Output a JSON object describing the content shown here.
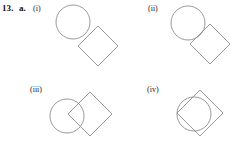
{
  "exercise": {
    "number": "13.",
    "part": "a."
  },
  "panels": [
    {
      "label": "(i)",
      "label_x": 33,
      "label_y": 4,
      "box": {
        "x": 50,
        "y": 2,
        "w": 73,
        "h": 68
      },
      "relation": "disjoint-touching",
      "circle": {
        "cx": 23,
        "cy": 20,
        "r": 17
      },
      "square": {
        "cx": 48,
        "cy": 44,
        "half_diagonal": 20,
        "rotation_deg": 45
      }
    },
    {
      "label": "(ii)",
      "label_x": 148,
      "label_y": 4,
      "box": {
        "x": 165,
        "y": 2,
        "w": 76,
        "h": 68
      },
      "relation": "tangent-point",
      "circle": {
        "cx": 23,
        "cy": 21,
        "r": 17
      },
      "square": {
        "cx": 45,
        "cy": 42,
        "half_diagonal": 20,
        "rotation_deg": 45
      }
    },
    {
      "label": "(iii)",
      "label_x": 30,
      "label_y": 85,
      "box": {
        "x": 48,
        "y": 86,
        "w": 70,
        "h": 58
      },
      "relation": "partial-overlap",
      "circle": {
        "cx": 19,
        "cy": 30,
        "r": 17
      },
      "square": {
        "cx": 42,
        "cy": 28,
        "half_diagonal": 22,
        "rotation_deg": 45
      }
    },
    {
      "label": "(iv)",
      "label_x": 147,
      "label_y": 85,
      "box": {
        "x": 168,
        "y": 84,
        "w": 70,
        "h": 60
      },
      "relation": "inscribed",
      "circle": {
        "cx": 26,
        "cy": 30,
        "r": 17
      },
      "square": {
        "cx": 32,
        "cy": 29,
        "half_diagonal": 23,
        "rotation_deg": 45
      }
    }
  ],
  "style": {
    "stroke_color": "#8d8d8d",
    "background": "#ffffff",
    "text_color": "#111111"
  }
}
